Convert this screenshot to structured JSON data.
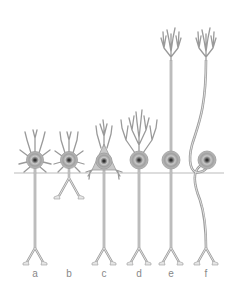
{
  "figure": {
    "colors": {
      "stroke": "#9a9a9a",
      "fill": "#e6e6e6",
      "soma_fill": "#a8a8a8",
      "nucleus": "#555555",
      "baseline": "#bbbbbb",
      "label": "#888888"
    },
    "cells": [
      {
        "label": "a",
        "x": 35
      },
      {
        "label": "b",
        "x": 69
      },
      {
        "label": "c",
        "x": 104
      },
      {
        "label": "d",
        "x": 139
      },
      {
        "label": "e",
        "x": 171
      },
      {
        "label": "f",
        "x": 206
      }
    ]
  }
}
